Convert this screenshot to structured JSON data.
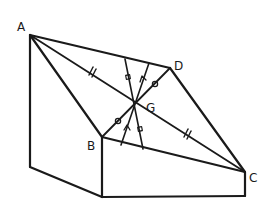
{
  "diagram": {
    "title": "",
    "colors": {
      "stroke": "#1a1a1a",
      "background": "#ffffff"
    },
    "points": {
      "A": {
        "label": "A",
        "x": 30,
        "y": 35
      },
      "B": {
        "label": "B",
        "x": 102,
        "y": 137
      },
      "C": {
        "label": "C",
        "x": 245,
        "y": 172
      },
      "D": {
        "label": "D",
        "x": 170,
        "y": 68
      },
      "G": {
        "label": "G",
        "x": 135,
        "y": 104
      }
    },
    "labels": {
      "A": "A",
      "B": "B",
      "C": "C",
      "D": "D",
      "G": "G"
    },
    "tick_marks": {
      "AG_GC": "double-tick (//)",
      "BG_GD": "circle mark",
      "transversal_1": "square mark",
      "transversal_2": "arrow mark"
    }
  }
}
